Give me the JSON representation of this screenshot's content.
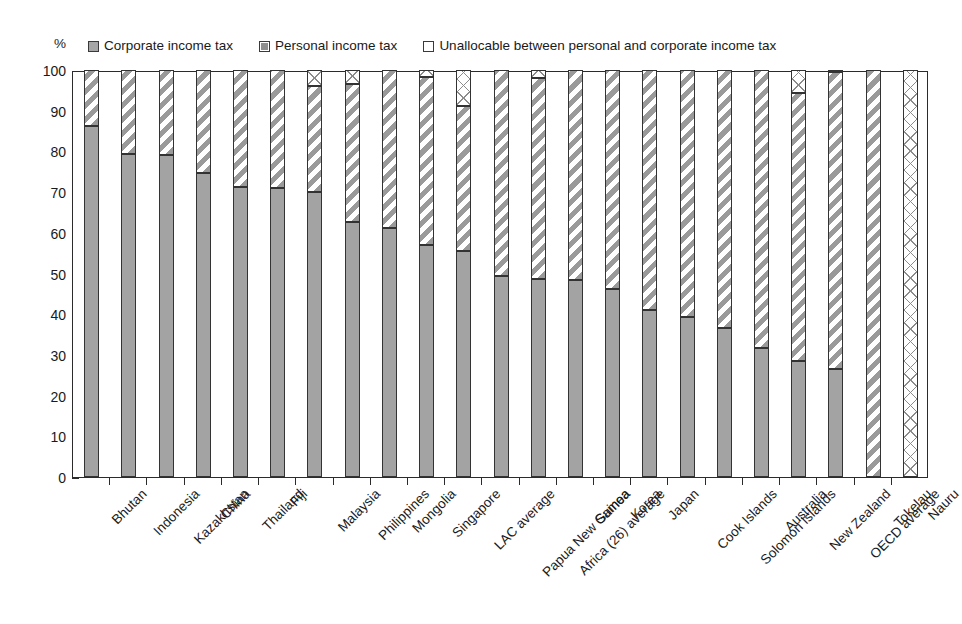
{
  "chart_data": {
    "type": "bar",
    "subtype": "stacked-bar-100",
    "title": "",
    "xlabel": "",
    "ylabel": "%",
    "ylim": [
      0,
      100
    ],
    "yticks": [
      0,
      10,
      20,
      30,
      40,
      50,
      60,
      70,
      80,
      90,
      100
    ],
    "ytick_labels": [
      "0",
      "10",
      "20",
      "30",
      "40",
      "50",
      "60",
      "70",
      "80",
      "90",
      "100"
    ],
    "grid": false,
    "legend_position": "top",
    "categories": [
      "Bhutan",
      "Indonesia",
      "Kazakhstan",
      "China",
      "Thailand",
      "Fiji",
      "Malaysia",
      "Philippines",
      "Mongolia",
      "Singapore",
      "LAC average",
      "Papua New Guinea",
      "Africa (26) average",
      "Samoa",
      "Korea",
      "Japan",
      "Cook Islands",
      "Solomon Islands",
      "Australia",
      "New Zealand",
      "OECD average",
      "Tokelau",
      "Nauru"
    ],
    "series": [
      {
        "name": "Corporate income tax",
        "color": "#a3a3a3",
        "pattern": "solid",
        "values": [
          86.3,
          79.3,
          79.0,
          74.8,
          71.3,
          70.9,
          70.0,
          62.6,
          61.2,
          57.0,
          55.5,
          49.5,
          48.6,
          48.5,
          46.2,
          41.1,
          39.3,
          36.7,
          31.6,
          28.4,
          26.5,
          0.0,
          0.0
        ]
      },
      {
        "name": "Personal income tax",
        "color": "#9a9a9a",
        "pattern": "diagonal-stripe",
        "values": [
          13.7,
          20.7,
          21.0,
          25.2,
          28.7,
          29.1,
          26.0,
          34.0,
          38.8,
          41.2,
          35.6,
          50.5,
          49.5,
          51.5,
          53.8,
          58.9,
          60.7,
          63.3,
          68.4,
          65.9,
          73.1,
          100.0,
          0.0
        ]
      },
      {
        "name": "Unallocable between personal and corporate income tax",
        "color": "#8c8c8c",
        "pattern": "cross-hatch",
        "values": [
          0.0,
          0.0,
          0.0,
          0.0,
          0.0,
          0.0,
          4.0,
          3.4,
          0.0,
          1.8,
          8.9,
          0.0,
          1.9,
          0.0,
          0.0,
          0.0,
          0.0,
          0.0,
          0.0,
          5.7,
          0.4,
          0.0,
          100.0
        ]
      }
    ]
  },
  "legend": {
    "entries": [
      {
        "label": "Corporate income tax",
        "swatch": "corp",
        "icon": "legend-swatch-filled-icon"
      },
      {
        "label": "Personal income tax",
        "swatch": "pers",
        "icon": "legend-swatch-hatched-icon"
      },
      {
        "label": "Unallocable between personal and corporate income tax",
        "swatch": "unal",
        "icon": "legend-swatch-empty-icon"
      }
    ]
  },
  "axis": {
    "unit": "%"
  },
  "colors": {
    "corporate": "#a3a3a3",
    "personal": "#9a9a9a",
    "unallocable": "#8c8c8c",
    "axis": "#2b2b2b",
    "background": "#ffffff"
  }
}
